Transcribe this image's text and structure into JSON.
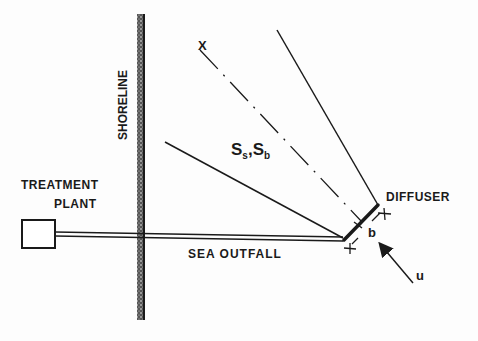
{
  "diagram": {
    "type": "schematic",
    "colors": {
      "ink": "#1a1a1a",
      "background": "#fdfdfd"
    },
    "labels": {
      "shoreline": "SHORELINE",
      "treatment_plant_line1": "TREATMENT",
      "treatment_plant_line2": "PLANT",
      "sea_outfall": "SEA OUTFALL",
      "diffuser": "DIFFUSER",
      "x_axis": "X",
      "dilution_main": "S",
      "dilution_sub1": "s",
      "dilution_sep": ",S",
      "dilution_sub2": "b",
      "diffuser_length": "b",
      "current": "u"
    },
    "nodes": [
      {
        "id": "treatment-plant",
        "label": "TREATMENT PLANT",
        "shape": "rectangle"
      },
      {
        "id": "shoreline",
        "label": "SHORELINE",
        "shape": "hatched-line"
      },
      {
        "id": "sea-outfall",
        "label": "SEA OUTFALL",
        "shape": "pipe"
      },
      {
        "id": "diffuser",
        "label": "DIFFUSER",
        "shape": "thick-line"
      },
      {
        "id": "plume",
        "label": "Ss,Sb",
        "shape": "fan"
      },
      {
        "id": "current",
        "label": "u",
        "shape": "arrow"
      }
    ],
    "edges": [
      {
        "from": "treatment-plant",
        "to": "diffuser",
        "label": "SEA OUTFALL"
      },
      {
        "from": "diffuser",
        "to": "plume",
        "label": "X"
      }
    ]
  }
}
